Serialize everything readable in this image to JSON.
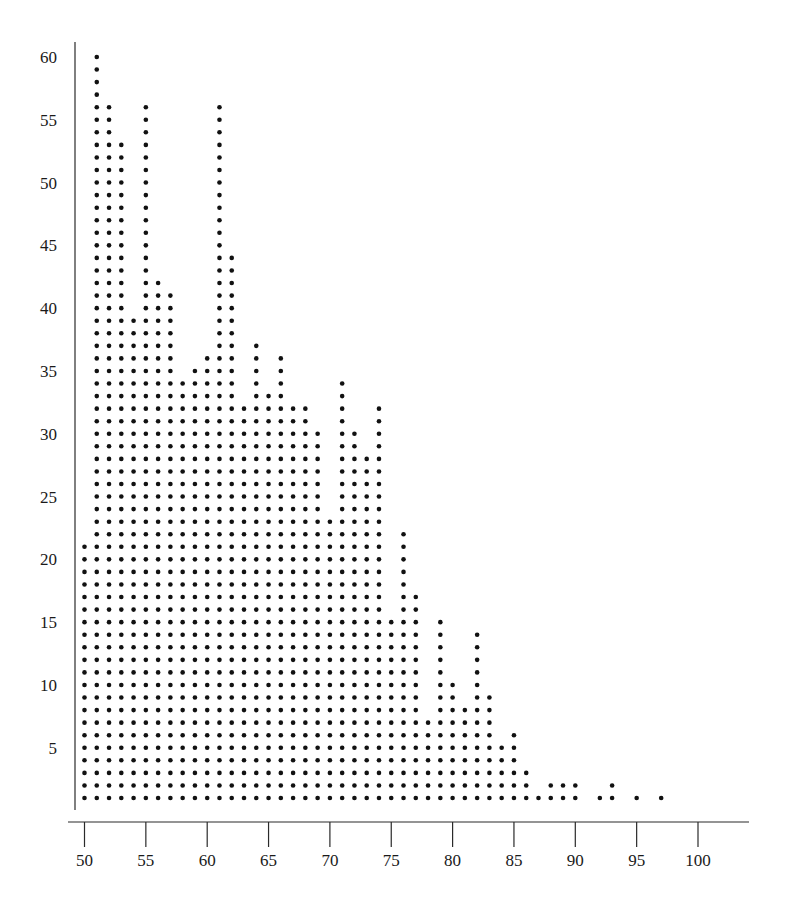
{
  "chart_data": {
    "type": "scatter",
    "subtype": "dot-plot (stacked dots per integer x value)",
    "title": "",
    "xlabel": "",
    "ylabel": "",
    "x_ticks": [
      50,
      55,
      60,
      65,
      70,
      75,
      80,
      85,
      90,
      95,
      100
    ],
    "y_ticks": [
      5,
      10,
      15,
      20,
      25,
      30,
      35,
      40,
      45,
      50,
      55,
      60
    ],
    "xlim": [
      49.2,
      104.5
    ],
    "ylim": [
      0,
      61
    ],
    "grid": false,
    "legend": null,
    "x": [
      50,
      51,
      52,
      53,
      54,
      55,
      56,
      57,
      58,
      59,
      60,
      61,
      62,
      63,
      64,
      65,
      66,
      67,
      68,
      69,
      70,
      71,
      72,
      73,
      74,
      75,
      76,
      77,
      78,
      79,
      80,
      81,
      82,
      83,
      84,
      85,
      86,
      87,
      88,
      89,
      90,
      91,
      92,
      93,
      94,
      95,
      96,
      97
    ],
    "values": [
      21,
      60,
      56,
      53,
      39,
      56,
      42,
      41,
      34,
      35,
      36,
      56,
      44,
      32,
      37,
      33,
      36,
      32,
      32,
      30,
      23,
      34,
      30,
      28,
      32,
      15,
      22,
      17,
      7,
      15,
      10,
      8,
      14,
      9,
      5,
      6,
      3,
      1,
      2,
      2,
      2,
      0,
      1,
      2,
      0,
      1,
      0,
      1
    ],
    "colors": {
      "dot": "#111111",
      "axis": "#2a2a2a",
      "text": "#1a1a1a",
      "background": "#ffffff"
    }
  }
}
